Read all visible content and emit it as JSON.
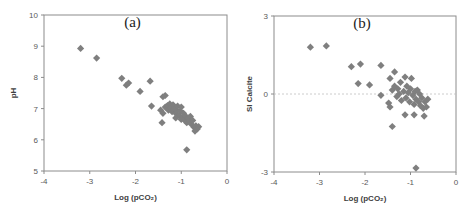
{
  "chart_data": [
    {
      "type": "scatter",
      "panel_label": "(a)",
      "xlabel": "Log (pCO₂)",
      "ylabel": "pH",
      "xlim": [
        -4,
        0
      ],
      "ylim": [
        5,
        10
      ],
      "xticks": [
        "-4",
        "-3",
        "-2",
        "-1",
        "0"
      ],
      "yticks": [
        "5",
        "6",
        "7",
        "8",
        "9",
        "10"
      ],
      "grid": false,
      "marker_color": "#7f7f7f",
      "points": [
        [
          -3.2,
          8.93
        ],
        [
          -2.85,
          8.62
        ],
        [
          -2.3,
          7.97
        ],
        [
          -2.2,
          7.75
        ],
        [
          -2.15,
          7.82
        ],
        [
          -1.9,
          7.55
        ],
        [
          -1.68,
          7.88
        ],
        [
          -1.65,
          7.08
        ],
        [
          -1.4,
          7.38
        ],
        [
          -1.35,
          7.42
        ],
        [
          -1.45,
          6.95
        ],
        [
          -1.4,
          6.85
        ],
        [
          -1.42,
          6.55
        ],
        [
          -1.35,
          7.05
        ],
        [
          -1.3,
          7.1
        ],
        [
          -1.28,
          6.95
        ],
        [
          -1.25,
          7.15
        ],
        [
          -1.22,
          7.02
        ],
        [
          -1.2,
          6.9
        ],
        [
          -1.18,
          7.12
        ],
        [
          -1.15,
          7.0
        ],
        [
          -1.12,
          6.85
        ],
        [
          -1.1,
          6.95
        ],
        [
          -1.08,
          7.08
        ],
        [
          -1.05,
          6.78
        ],
        [
          -1.02,
          6.92
        ],
        [
          -1.0,
          7.05
        ],
        [
          -0.98,
          6.7
        ],
        [
          -0.95,
          6.85
        ],
        [
          -0.92,
          6.62
        ],
        [
          -0.9,
          6.75
        ],
        [
          -0.88,
          6.55
        ],
        [
          -0.85,
          6.7
        ],
        [
          -0.82,
          6.6
        ],
        [
          -0.8,
          6.75
        ],
        [
          -0.78,
          6.5
        ],
        [
          -0.75,
          6.62
        ],
        [
          -0.72,
          6.4
        ],
        [
          -0.7,
          6.28
        ],
        [
          -0.68,
          6.45
        ],
        [
          -0.65,
          6.35
        ],
        [
          -0.62,
          6.42
        ],
        [
          -0.88,
          5.68
        ],
        [
          -1.12,
          6.7
        ],
        [
          -1.0,
          6.65
        ]
      ]
    },
    {
      "type": "scatter",
      "panel_label": "(b)",
      "xlabel": "Log (pCO₂)",
      "ylabel": "SI Calcite",
      "xlim": [
        -4,
        0
      ],
      "ylim": [
        -3,
        3
      ],
      "xticks": [
        "-4",
        "-3",
        "-2",
        "-1",
        "0"
      ],
      "yticks": [
        "-3",
        "0",
        "3"
      ],
      "reference_line": 0,
      "grid": false,
      "marker_color": "#7f7f7f",
      "points": [
        [
          -3.2,
          1.8
        ],
        [
          -2.85,
          1.85
        ],
        [
          -2.3,
          1.05
        ],
        [
          -2.1,
          1.15
        ],
        [
          -2.15,
          0.4
        ],
        [
          -1.9,
          0.35
        ],
        [
          -1.65,
          1.1
        ],
        [
          -1.65,
          -0.05
        ],
        [
          -1.45,
          0.6
        ],
        [
          -1.35,
          0.85
        ],
        [
          -1.48,
          -0.35
        ],
        [
          -1.45,
          -0.5
        ],
        [
          -1.4,
          -1.25
        ],
        [
          -1.4,
          0.15
        ],
        [
          -1.35,
          0.3
        ],
        [
          -1.3,
          -0.1
        ],
        [
          -1.28,
          0.2
        ],
        [
          -1.25,
          0.0
        ],
        [
          -1.22,
          0.45
        ],
        [
          -1.2,
          -0.25
        ],
        [
          -1.15,
          0.1
        ],
        [
          -1.12,
          0.65
        ],
        [
          -1.1,
          -0.15
        ],
        [
          -1.08,
          0.3
        ],
        [
          -1.05,
          0.05
        ],
        [
          -1.02,
          -0.3
        ],
        [
          -1.0,
          0.2
        ],
        [
          -0.98,
          0.6
        ],
        [
          -0.95,
          -0.05
        ],
        [
          -0.92,
          -0.4
        ],
        [
          -0.9,
          0.1
        ],
        [
          -0.88,
          -0.2
        ],
        [
          -0.85,
          0.15
        ],
        [
          -0.82,
          -0.3
        ],
        [
          -0.8,
          0.0
        ],
        [
          -0.78,
          -0.45
        ],
        [
          -0.75,
          -0.15
        ],
        [
          -0.72,
          -0.55
        ],
        [
          -0.7,
          -0.85
        ],
        [
          -0.68,
          -0.3
        ],
        [
          -0.65,
          -0.5
        ],
        [
          -0.62,
          -0.2
        ],
        [
          -1.12,
          -0.8
        ],
        [
          -0.92,
          -0.8
        ],
        [
          -0.88,
          -2.85
        ]
      ]
    }
  ]
}
